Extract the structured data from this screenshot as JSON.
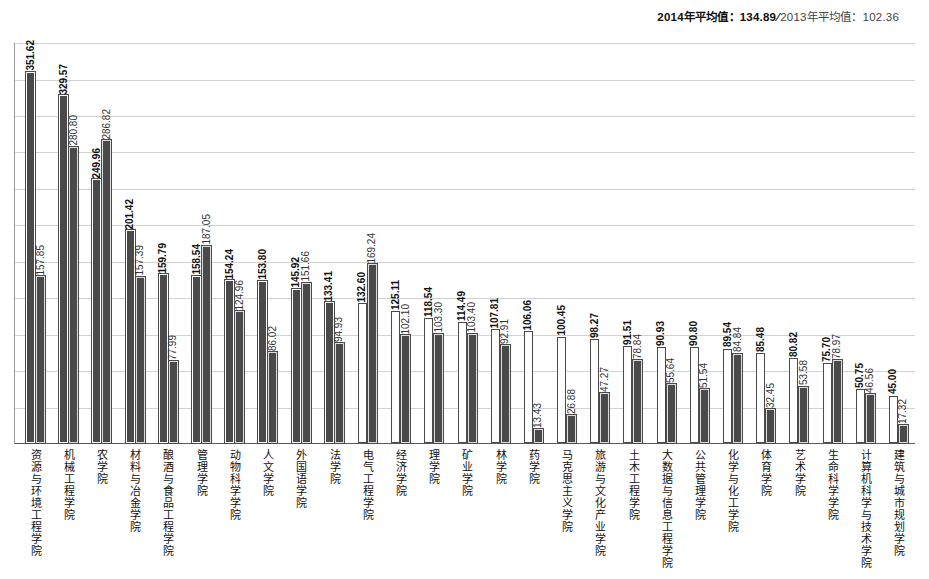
{
  "header": {
    "label_2014": "2014年平均值：134.89",
    "separator": "∕",
    "label_2013": "2013年平均值：102.36"
  },
  "chart_data": {
    "type": "bar",
    "title": "",
    "xlabel": "",
    "ylabel": "",
    "ylim": [
      0,
      380
    ],
    "grid": true,
    "gridline_count": 11,
    "legend_position": "top-right",
    "categories": [
      "资源与环境工程学院",
      "机械工程学院",
      "农学院",
      "材料与冶金学院",
      "酿酒与食品工程学院",
      "管理学院",
      "动物科学学院",
      "人文学院",
      "外国语学院",
      "法学院",
      "电气工程学院",
      "经济学院",
      "理学院",
      "矿业学院",
      "林学院",
      "药学院",
      "马克思主义学院",
      "旅游与文化产业学院",
      "土木工程学院",
      "大数据与信息工程学院",
      "公共管理学院",
      "化学与化工学院",
      "体育学院",
      "艺术学院",
      "生命科学学院",
      "计算机科学与技术学院",
      "建筑与城市规划学院"
    ],
    "series": [
      {
        "name": "2014年",
        "values": [
          351.62,
          329.57,
          249.96,
          201.42,
          159.79,
          158.54,
          154.24,
          153.8,
          145.92,
          133.41,
          132.6,
          125.11,
          118.54,
          114.49,
          107.81,
          106.06,
          100.45,
          98.27,
          91.51,
          90.93,
          90.8,
          89.54,
          85.48,
          80.82,
          75.7,
          50.75,
          45.0
        ]
      },
      {
        "name": "2013年",
        "values": [
          157.85,
          280.8,
          286.82,
          157.39,
          77.99,
          187.05,
          124.96,
          86.02,
          151.66,
          94.93,
          169.24,
          102.1,
          103.3,
          103.4,
          92.91,
          13.43,
          26.88,
          47.27,
          78.84,
          55.64,
          51.54,
          84.84,
          32.45,
          53.58,
          78.97,
          46.56,
          17.32
        ]
      }
    ],
    "bar_styles": {
      "note": "dark = filled gray bar, hollow = white bar with dark outline",
      "series_2014_dark_indices": [
        0,
        1,
        2,
        3,
        4,
        5,
        6,
        7,
        8,
        9
      ],
      "series_2013_dark_all": true
    },
    "average_2014": 134.89,
    "average_2013": 102.36
  }
}
